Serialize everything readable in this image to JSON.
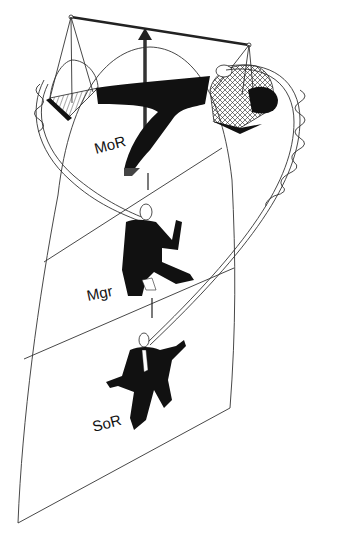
{
  "figure": {
    "type": "illustration",
    "colors": {
      "ink": "#111111",
      "line": "#333333",
      "background": "#ffffff"
    }
  },
  "levels": [
    {
      "id": "top",
      "label": "MoR"
    },
    {
      "id": "middle",
      "label": "Mgr"
    },
    {
      "id": "bottom",
      "label": "SoR"
    }
  ],
  "elements": {
    "scale_beam": "balance-beam",
    "center_arrow": "up-arrow",
    "left_pan": "left-scale-pan",
    "right_pan": "right-scale-pan",
    "ribbon": "twisting-ribbon"
  }
}
